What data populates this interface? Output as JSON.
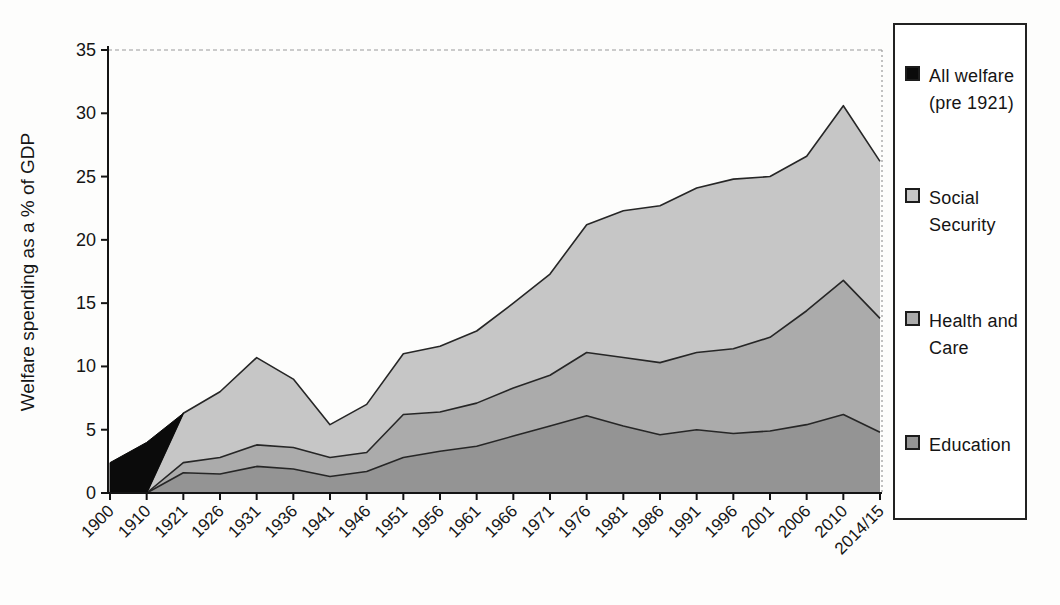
{
  "figure": {
    "ylabel": "Welfare spending as a % of GDP",
    "background": "#ffffff",
    "axis_color": "#141414",
    "outline_color": "#262626",
    "grid_color": "#9a9a9a"
  },
  "chart_data": {
    "type": "area",
    "stacked": true,
    "title": "",
    "xlabel": "",
    "ylabel": "Welfare spending as a % of GDP",
    "ylim": [
      0,
      35
    ],
    "yticks": [
      0,
      5,
      10,
      15,
      20,
      25,
      30,
      35
    ],
    "grid": "dashed line at y=35 only",
    "legend_position": "outside right",
    "categories": [
      "1900",
      "1910",
      "1921",
      "1926",
      "1931",
      "1936",
      "1941",
      "1946",
      "1951",
      "1956",
      "1961",
      "1966",
      "1971",
      "1976",
      "1981",
      "1986",
      "1991",
      "1996",
      "2001",
      "2006",
      "2010",
      "2014/15"
    ],
    "series": [
      {
        "name": "Education",
        "color": "#949494",
        "values": [
          null,
          0,
          1.6,
          1.5,
          2.1,
          1.9,
          1.3,
          1.7,
          2.8,
          3.3,
          3.7,
          4.5,
          5.3,
          6.1,
          5.3,
          4.6,
          5.0,
          4.7,
          4.9,
          5.4,
          6.2,
          4.8
        ]
      },
      {
        "name": "Health and Care",
        "color": "#ababab",
        "values": [
          null,
          0,
          0.8,
          1.3,
          1.7,
          1.7,
          1.5,
          1.5,
          3.4,
          3.1,
          3.4,
          3.8,
          4.0,
          5.0,
          5.4,
          5.7,
          6.1,
          6.7,
          7.4,
          9.0,
          10.6,
          9.0
        ]
      },
      {
        "name": "Social Security",
        "color": "#c6c6c6",
        "values": [
          null,
          0,
          3.9,
          5.2,
          6.9,
          5.4,
          2.6,
          3.8,
          4.8,
          5.2,
          5.7,
          6.7,
          8.0,
          10.1,
          11.6,
          12.4,
          13.0,
          13.4,
          12.7,
          12.2,
          13.8,
          12.4
        ]
      }
    ],
    "stacked_totals": [
      null,
      0,
      6.3,
      8.0,
      10.7,
      9.0,
      5.4,
      7.0,
      11.0,
      11.6,
      12.8,
      15.0,
      17.3,
      21.2,
      22.3,
      22.7,
      24.1,
      24.8,
      25.0,
      26.6,
      30.6,
      26.2
    ],
    "overlay_series": {
      "name": "All welfare (pre 1921)",
      "color": "#0b0b0b",
      "points": [
        [
          "1900",
          2.4
        ],
        [
          "1910",
          4.0
        ],
        [
          "1921",
          6.3
        ]
      ],
      "baseline_points": [
        [
          "1900",
          0
        ],
        [
          "1910",
          0
        ]
      ]
    }
  },
  "legend": {
    "items": [
      {
        "label": "All welfare\n(pre 1921)",
        "color": "#0b0b0b"
      },
      {
        "label": "Social\nSecurity",
        "color": "#c6c6c6"
      },
      {
        "label": "Health and\nCare",
        "color": "#ababab"
      },
      {
        "label": "Education",
        "color": "#949494"
      }
    ]
  }
}
